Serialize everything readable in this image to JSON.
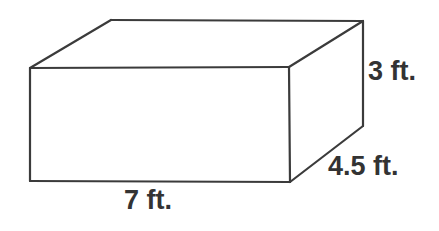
{
  "figure": {
    "shape_name": "rectangular-prism",
    "background_color": "#ffffff",
    "line_color": "#3b3b3b",
    "line_width": 2,
    "text_color": "#333333",
    "labels": {
      "height": "3 ft.",
      "depth": "4.5 ft.",
      "width": "7 ft."
    },
    "measurements": [
      {
        "name": "width",
        "value": 7,
        "unit": "ft.",
        "text": "7 ft."
      },
      {
        "name": "depth",
        "value": 4.5,
        "unit": "ft.",
        "text": "4.5 ft."
      },
      {
        "name": "height",
        "value": 3,
        "unit": "ft.",
        "text": "3 ft."
      }
    ],
    "geometry": {
      "front_face": "30,68 289,67 290,182 30,181",
      "top_face": "30,68 111,20 363,21 289,67",
      "right_face": "289,67 363,21 363,126 290,182",
      "front_top_left": "30,68",
      "front_top_right": "289,67",
      "front_bottom_right": "290,182",
      "front_bottom_left": "30,181",
      "back_top_left": "111,20",
      "back_top_right": "363,21",
      "back_bottom_right": "363,126"
    }
  }
}
